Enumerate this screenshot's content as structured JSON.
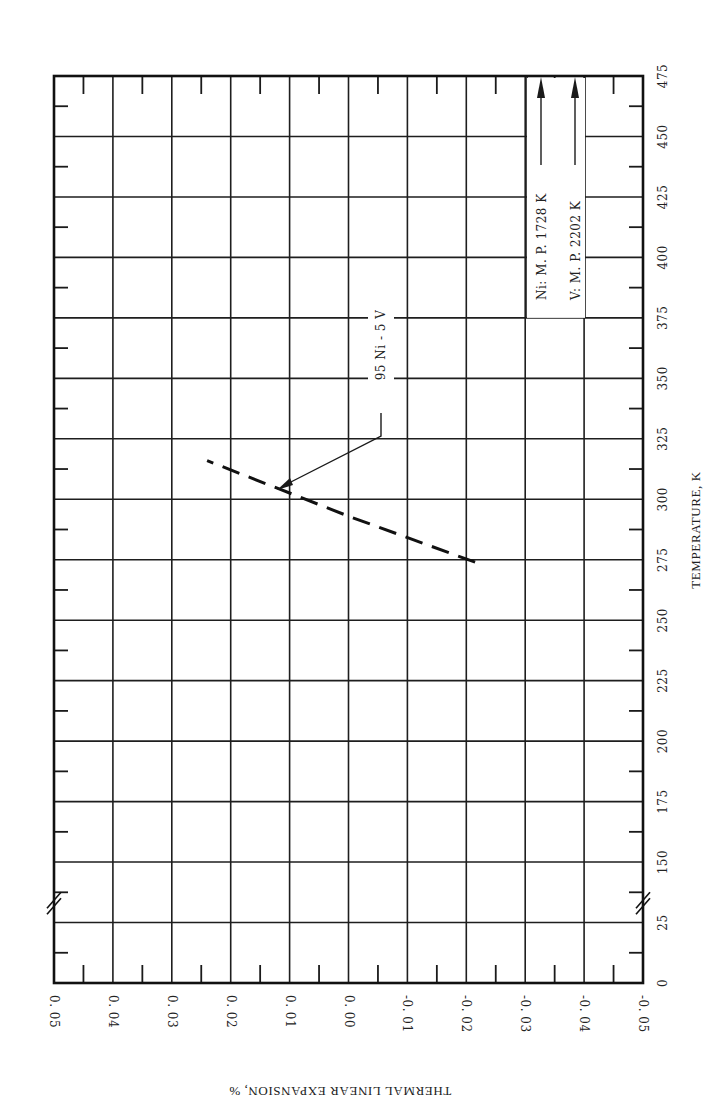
{
  "chart_data": {
    "type": "line",
    "orientation": "rotated-90-ccw",
    "title": "",
    "xlabel": "TEMPERATURE, K",
    "ylabel": "THERMAL LINEAR EXPANSION, %",
    "x_ticks": [
      "0",
      "25",
      "150",
      "175",
      "200",
      "225",
      "250",
      "275",
      "300",
      "325",
      "350",
      "375",
      "400",
      "425",
      "450",
      "475"
    ],
    "x_tick_values": [
      0,
      25,
      150,
      175,
      200,
      225,
      250,
      275,
      300,
      325,
      350,
      375,
      400,
      425,
      450,
      475
    ],
    "x_axis_break": "between 25 and 150",
    "y_ticks": [
      "0.05",
      "0.04",
      "0.03",
      "0.02",
      "0.01",
      "0.00",
      "-0.01",
      "-0.02",
      "-0.03",
      "-0.04",
      "-0.05"
    ],
    "y_tick_values": [
      0.05,
      0.04,
      0.03,
      0.02,
      0.01,
      0.0,
      -0.01,
      -0.02,
      -0.03,
      -0.04,
      -0.05
    ],
    "ylim": [
      -0.05,
      0.05
    ],
    "grid": true,
    "series": [
      {
        "name": "95 Ni - 5 V",
        "style": "dashed",
        "x": [
          274,
          293,
          316
        ],
        "values": [
          -0.0215,
          0.0,
          0.024
        ]
      }
    ],
    "annotations": [
      {
        "text": "95 Ni - 5 V",
        "points_to": {
          "x": 305,
          "y": 0.011
        }
      },
      {
        "text": "Ni:  M. P.  1728 K",
        "arrow": "up"
      },
      {
        "text": "V:  M. P.  2202 K",
        "arrow": "up"
      }
    ]
  },
  "labels": {
    "series_label": "95 Ni - 5 V",
    "ni_mp": "Ni:  M. P.  1728 K",
    "v_mp": "V:  M. P.  2202 K",
    "xlabel": "TEMPERATURE, K",
    "ylabel": "THERMAL LINEAR EXPANSION, %"
  },
  "colors": {
    "ink": "#1a1a1a",
    "paper": "#ffffff"
  }
}
